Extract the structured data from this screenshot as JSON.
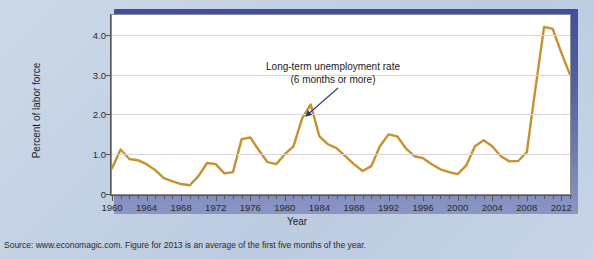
{
  "chart_data": {
    "type": "line",
    "title": "",
    "xlabel": "Year",
    "ylabel": "Percent of labor force",
    "xlim": [
      1960,
      2013
    ],
    "ylim": [
      0,
      4.5
    ],
    "grid": true,
    "legend_position": "none",
    "line_color": "#c8912e",
    "annotations": [
      {
        "line1": "Long-term unemployment rate",
        "line2": "(6 months or more)",
        "points_to_year": 1983
      }
    ],
    "y_ticks": [
      "0",
      "1.0",
      "2.0",
      "3.0",
      "4.0"
    ],
    "y_tick_values": [
      0,
      1.0,
      2.0,
      3.0,
      4.0
    ],
    "x_ticks": [
      "1960",
      "1964",
      "1968",
      "1972",
      "1976",
      "1980",
      "1984",
      "1988",
      "1992",
      "1996",
      "2000",
      "2004",
      "2008",
      "2012"
    ],
    "x_tick_values": [
      1960,
      1964,
      1968,
      1972,
      1976,
      1980,
      1984,
      1988,
      1992,
      1996,
      2000,
      2004,
      2008,
      2012
    ],
    "series": [
      {
        "name": "Long-term unemployment rate (6 months or more)",
        "x": [
          1960,
          1961,
          1962,
          1963,
          1964,
          1965,
          1966,
          1967,
          1968,
          1969,
          1970,
          1971,
          1972,
          1973,
          1974,
          1975,
          1976,
          1977,
          1978,
          1979,
          1980,
          1981,
          1982,
          1983,
          1984,
          1985,
          1986,
          1987,
          1988,
          1989,
          1990,
          1991,
          1992,
          1993,
          1994,
          1995,
          1996,
          1997,
          1998,
          1999,
          2000,
          2001,
          2002,
          2003,
          2004,
          2005,
          2006,
          2007,
          2008,
          2009,
          2010,
          2011,
          2012,
          2013
        ],
        "values": [
          0.65,
          1.12,
          0.88,
          0.85,
          0.75,
          0.6,
          0.4,
          0.32,
          0.25,
          0.22,
          0.45,
          0.78,
          0.75,
          0.52,
          0.55,
          1.38,
          1.42,
          1.1,
          0.8,
          0.75,
          1.0,
          1.2,
          1.9,
          2.25,
          1.45,
          1.25,
          1.15,
          0.95,
          0.75,
          0.58,
          0.7,
          1.2,
          1.5,
          1.45,
          1.15,
          0.95,
          0.9,
          0.75,
          0.62,
          0.55,
          0.5,
          0.72,
          1.2,
          1.35,
          1.2,
          0.95,
          0.82,
          0.83,
          1.05,
          2.65,
          4.2,
          4.15,
          3.55,
          3.0
        ]
      }
    ]
  },
  "source": {
    "text": "Source: www.economagic.com. Figure for 2013 is an average of the first five months of the year."
  }
}
